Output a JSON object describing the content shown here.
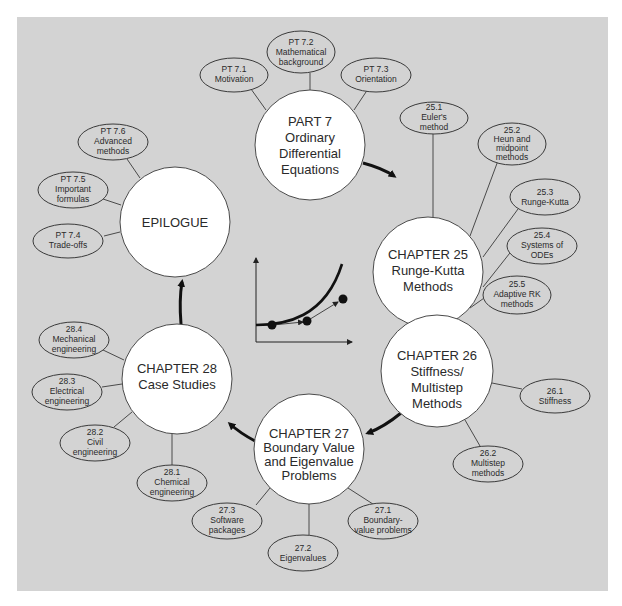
{
  "diagram": {
    "background_color": "#d3d3d3",
    "main_nodes": [
      {
        "id": "part7",
        "lines": [
          "PART 7",
          "Ordinary",
          "Differential",
          "Equations"
        ]
      },
      {
        "id": "ch25",
        "lines": [
          "CHAPTER 25",
          "Runge-Kutta",
          "Methods"
        ]
      },
      {
        "id": "ch26",
        "lines": [
          "CHAPTER 26",
          "Stiffness/",
          "Multistep",
          "Methods"
        ]
      },
      {
        "id": "ch27",
        "lines": [
          "CHAPTER 27",
          "Boundary Value",
          "and Eigenvalue",
          "Problems"
        ]
      },
      {
        "id": "ch28",
        "lines": [
          "CHAPTER 28",
          "Case Studies"
        ]
      },
      {
        "id": "epilogue",
        "lines": [
          "EPILOGUE"
        ]
      }
    ],
    "sub_nodes": {
      "part7": [
        {
          "lines": [
            "PT 7.1",
            "Motivation"
          ]
        },
        {
          "lines": [
            "PT 7.2",
            "Mathematical",
            "background"
          ]
        },
        {
          "lines": [
            "PT 7.3",
            "Orientation"
          ]
        }
      ],
      "ch25": [
        {
          "lines": [
            "25.1",
            "Euler's",
            "method"
          ]
        },
        {
          "lines": [
            "25.2",
            "Heun and",
            "midpoint",
            "methods"
          ]
        },
        {
          "lines": [
            "25.3",
            "Runge-Kutta"
          ]
        },
        {
          "lines": [
            "25.4",
            "Systems of",
            "ODEs"
          ]
        },
        {
          "lines": [
            "25.5",
            "Adaptive RK",
            "methods"
          ]
        }
      ],
      "ch26": [
        {
          "lines": [
            "26.1",
            "Stiffness"
          ]
        },
        {
          "lines": [
            "26.2",
            "Multistep",
            "methods"
          ]
        }
      ],
      "ch27": [
        {
          "lines": [
            "27.1",
            "Boundary-",
            "value problems"
          ]
        },
        {
          "lines": [
            "27.2",
            "Eigenvalues"
          ]
        },
        {
          "lines": [
            "27.3",
            "Software",
            "packages"
          ]
        }
      ],
      "ch28": [
        {
          "lines": [
            "28.1",
            "Chemical",
            "engineering"
          ]
        },
        {
          "lines": [
            "28.2",
            "Civil",
            "engineering"
          ]
        },
        {
          "lines": [
            "28.3",
            "Electrical",
            "engineering"
          ]
        },
        {
          "lines": [
            "28.4",
            "Mechanical",
            "engineering"
          ]
        }
      ],
      "epilogue": [
        {
          "lines": [
            "PT 7.4",
            "Trade-offs"
          ]
        },
        {
          "lines": [
            "PT 7.5",
            "Important",
            "formulas"
          ]
        },
        {
          "lines": [
            "PT 7.6",
            "Advanced",
            "methods"
          ]
        }
      ]
    },
    "flow_order": [
      "part7",
      "ch25",
      "ch26",
      "ch27",
      "ch28",
      "epilogue"
    ],
    "center_icon": "ode-solution-curve-icon"
  }
}
